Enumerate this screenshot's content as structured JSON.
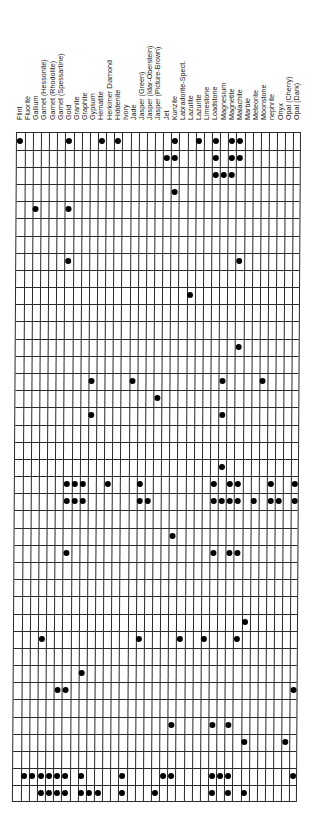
{
  "chart_data": {
    "type": "table",
    "title": "",
    "columns": [
      "Flint",
      "Fluorite",
      "Gallium",
      "Garnet (Hessonite)",
      "Garnet (Rhodolite)",
      "Garnet (Spessartine)",
      "Gold",
      "Granite",
      "Graphite",
      "Gypsum",
      "Hematite",
      "Herkimer Diamond",
      "Hiddenite",
      "Ivory",
      "Jade",
      "Jasper (Green)",
      "Jasper (Idar-Oberstein)",
      "Jasper (Picture-Brown)",
      "Jet",
      "Kunzite",
      "Labradorite-Spect.",
      "Lazulite",
      "Lazurite",
      "Limestone",
      "Loadstone",
      "Magnesium",
      "Magnetite",
      "Malachite",
      "Marble",
      "Meteorite",
      "Moonstone",
      "nephrite",
      "Onyx",
      "Opal (Cherry)",
      "Opal (Dark)"
    ],
    "row_count": 39,
    "dots_by_row": {
      "0": [
        0,
        6,
        10,
        12,
        19,
        22,
        24,
        26,
        27
      ],
      "1": [
        18,
        19,
        24,
        26,
        27
      ],
      "2": [
        24,
        25,
        26
      ],
      "3": [
        19
      ],
      "4": [
        2,
        6
      ],
      "7": [
        6,
        27
      ],
      "9": [
        21
      ],
      "12": [
        27
      ],
      "14": [
        9,
        14,
        25,
        30
      ],
      "15": [
        17
      ],
      "16": [
        9,
        25
      ],
      "19": [
        25
      ],
      "20": [
        6,
        7,
        8,
        11,
        15,
        24,
        26,
        27,
        31,
        34
      ],
      "21": [
        6,
        7,
        8,
        15,
        16,
        24,
        25,
        26,
        27,
        29,
        31,
        32,
        34
      ],
      "23": [
        19
      ],
      "24": [
        6,
        24,
        26,
        27
      ],
      "28": [
        28
      ],
      "29": [
        3,
        15,
        20,
        23,
        27
      ],
      "31": [
        8
      ],
      "32": [
        5,
        6,
        34
      ],
      "34": [
        19,
        24,
        26
      ],
      "35": [
        28,
        33
      ],
      "37": [
        1,
        2,
        3,
        4,
        5,
        6,
        8,
        13,
        18,
        19,
        24,
        25,
        26,
        34
      ],
      "38": [
        3,
        4,
        5,
        6,
        8,
        9,
        10,
        13,
        17,
        24,
        26,
        28
      ]
    },
    "grid": true,
    "legend": null,
    "xlabel": "",
    "ylabel": ""
  },
  "style": {
    "line_color": "#2a2a2a",
    "dot_color": "#000000",
    "background": "#ffffff"
  }
}
